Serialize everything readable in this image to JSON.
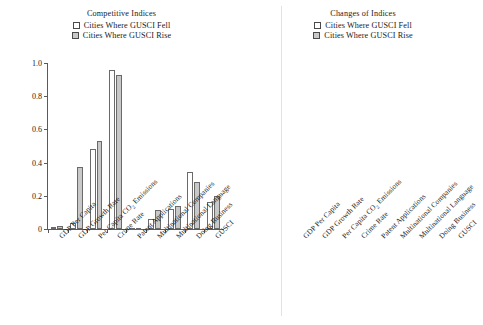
{
  "chart_data": [
    {
      "type": "bar",
      "title": "Competitive Indices",
      "xlabel": "",
      "ylabel": "",
      "ylim": [
        0,
        1.0
      ],
      "yticks": [
        "0",
        "0.2",
        "0.4",
        "0.6",
        "0.8",
        "1.0"
      ],
      "ytick_values": [
        0,
        0.2,
        0.4,
        0.6,
        0.8,
        1.0
      ],
      "grid": false,
      "legend_position": "top-center",
      "categories": [
        "GDP Per Capita",
        "GDP Growth Rate",
        "Per Capita CO2 Emissions",
        "Crime Rate",
        "Patent Applications",
        "Multinational Companies",
        "Multinational Language",
        "Doing Business",
        "GUSCI"
      ],
      "series": [
        {
          "name": "Cities Where GUSCI Fell",
          "color": "#ffffff",
          "values": [
            0.012,
            0.035,
            0.48,
            0.955,
            0.005,
            0.06,
            0.12,
            0.345,
            0.165
          ]
        },
        {
          "name": "Cities Where GUSCI Rise",
          "color": "#c8c8c8",
          "values": [
            0.018,
            0.375,
            0.53,
            0.925,
            0.008,
            0.115,
            0.14,
            0.285,
            0.2
          ]
        }
      ]
    },
    {
      "type": "bar",
      "title": "Changes of Indices",
      "xlabel": "",
      "ylabel": "",
      "ylim": [
        -0.5,
        0.2
      ],
      "yticks": [
        "0.20",
        "0.15",
        "0.10",
        "0.05",
        "0",
        "−0.05",
        "−0.10",
        "−0.15",
        "−0.20",
        "−0.25",
        "−0.30",
        "−0.35",
        "−0.40",
        "−0.45",
        "−0.50"
      ],
      "ytick_values": [
        0.2,
        0.15,
        0.1,
        0.05,
        0,
        -0.05,
        -0.1,
        -0.15,
        -0.2,
        -0.25,
        -0.3,
        -0.35,
        -0.4,
        -0.45,
        -0.5
      ],
      "grid": false,
      "legend_position": "top-center",
      "categories": [
        "GDP Per Capita",
        "GDP Growth Rate",
        "Per Capita CO2 Emissions",
        "Crime Rate",
        "Patent Applications",
        "Multinational Companies",
        "Multinational Language",
        "Doing Business",
        "GUSCI"
      ],
      "series": [
        {
          "name": "Cities Where GUSCI Fell",
          "color": "#ffffff",
          "values": [
            -0.003,
            -0.475,
            -0.002,
            -0.002,
            -0.004,
            -0.002,
            -0.002,
            -0.002,
            -0.012
          ]
        },
        {
          "name": "Cities Where GUSCI Rise",
          "color": "#c8c8c8",
          "values": [
            -0.002,
            -0.035,
            -0.002,
            -0.002,
            -0.003,
            -0.002,
            -0.002,
            -0.002,
            0.018
          ]
        }
      ]
    }
  ],
  "panels": [
    {
      "title": "Competitive Indices",
      "legend": [
        {
          "label": "Cities Where GUSCI Fell",
          "swatch": "white"
        },
        {
          "label": "Cities Where GUSCI Rise",
          "swatch": "gray"
        }
      ],
      "axis_labels": [
        "GDP Per Capita",
        "GDP Growth Rate",
        "Per Capita CO",
        "Crime Rate",
        "Patent Applications",
        "Multinational Companies",
        "Multinational Language",
        "Doing Business",
        "GUSCI"
      ]
    },
    {
      "title": "Changes of Indices",
      "legend": [
        {
          "label": "Cities Where GUSCI Fell",
          "swatch": "white"
        },
        {
          "label": "Cities Where GUSCI Rise",
          "swatch": "gray"
        }
      ],
      "axis_labels": [
        "GDP Per Capita",
        "GDP Growth Rate",
        "Per Capita CO",
        "Crime Rate",
        "Patent Applications",
        "Multinational Companies",
        "Multinational Language",
        "Doing Business",
        "GUSCI"
      ]
    }
  ],
  "co2_subscript": "2",
  "co2_suffix": " Emissions",
  "colors": {
    "fell": "#ffffff",
    "rise": "#c8c8c8",
    "axis": "#5a5a5a",
    "text": "#1a1a1a"
  }
}
